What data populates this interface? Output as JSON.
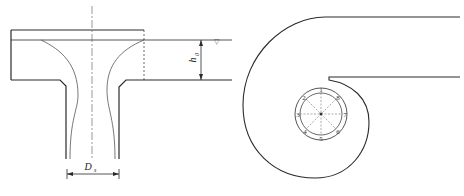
{
  "figure": {
    "left_panel": {
      "name": "vertical intake with bell-mouth (free-surface vortex) section",
      "labels": {
        "submergence": "h",
        "submergence_sub": "0",
        "diameter": "D",
        "diameter_sub": "s"
      },
      "water_surface_symbol": "▽"
    },
    "right_panel": {
      "name": "spiral (volute) intake plan view",
      "probe_numbers": [
        "1",
        "2",
        "3",
        "4",
        "5",
        "6",
        "7",
        "8"
      ]
    }
  },
  "colors": {
    "line": "#2a2a2a",
    "thin_line": "#555555",
    "background": "#ffffff"
  }
}
